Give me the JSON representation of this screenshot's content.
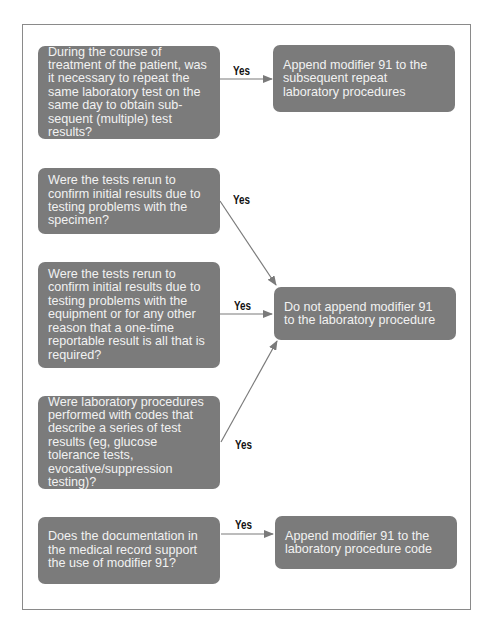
{
  "diagram": {
    "type": "flowchart",
    "colors": {
      "box_fill": "#7b7b7b",
      "box_text": "#f2f2f2",
      "arrow": "#7a7a7a",
      "frame_border": "#8a8a8a",
      "label": "#111111"
    },
    "questions": [
      {
        "id": "q1",
        "text": "During the course of treatment of the patient, was it necessary to repeat the same laboratory test on the same day to obtain sub-sequent (multiple) test results?"
      },
      {
        "id": "q2",
        "text": "Were the tests rerun to confirm initial results due to testing problems with the specimen?"
      },
      {
        "id": "q3",
        "text": "Were the tests rerun to confirm initial results due to testing problems with the equipment or for any other reason that a one-time reportable result is all that is required?"
      },
      {
        "id": "q4",
        "text": "Were laboratory procedures performed with codes that describe a series of test results (eg, glucose tolerance tests, evocative/suppression testing)?"
      },
      {
        "id": "q5",
        "text": "Does the documentation in the medical record support the use of modifier 91?"
      }
    ],
    "outcomes": [
      {
        "id": "a1",
        "text": "Append modifier 91 to the subsequent repeat laboratory procedures"
      },
      {
        "id": "a2",
        "text": "Do not append modifier 91 to the laboratory procedure"
      },
      {
        "id": "a3",
        "text": "Append modifier 91 to the laboratory procedure code"
      }
    ],
    "edges": [
      {
        "from": "q1",
        "to": "a1",
        "label": "Yes"
      },
      {
        "from": "q2",
        "to": "a2",
        "label": "Yes"
      },
      {
        "from": "q3",
        "to": "a2",
        "label": "Yes"
      },
      {
        "from": "q4",
        "to": "a2",
        "label": "Yes"
      },
      {
        "from": "q5",
        "to": "a3",
        "label": "Yes"
      }
    ]
  }
}
